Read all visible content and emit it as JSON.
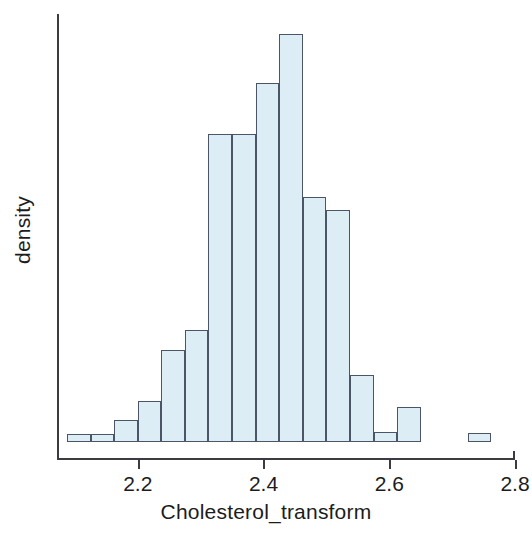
{
  "chart_data": {
    "type": "bar",
    "subtype": "histogram",
    "title": "",
    "xlabel": "Cholesterol_transform",
    "ylabel": "density",
    "xlim": [
      2.0716,
      2.8
    ],
    "ylim": [
      0,
      10.5
    ],
    "grid": false,
    "legend": false,
    "bin_width": 0.0375,
    "xticks": [
      "2.2",
      "2.4",
      "2.6",
      "2.8"
    ],
    "xtick_values": [
      2.2,
      2.4,
      2.6,
      2.8
    ],
    "yticks": [],
    "bar_fill_color": "#dcedf5",
    "bar_edge_color": "#4a5566",
    "axis_color": "#3b3b42",
    "bins": [
      {
        "x0": 2.0875,
        "x1": 2.125,
        "density": 0.2
      },
      {
        "x0": 2.125,
        "x1": 2.1625,
        "density": 0.2
      },
      {
        "x0": 2.1625,
        "x1": 2.2,
        "density": 0.55
      },
      {
        "x0": 2.2,
        "x1": 2.2375,
        "density": 1.0
      },
      {
        "x0": 2.2375,
        "x1": 2.275,
        "density": 2.25
      },
      {
        "x0": 2.275,
        "x1": 2.3125,
        "density": 2.75
      },
      {
        "x0": 2.3125,
        "x1": 2.35,
        "density": 7.55
      },
      {
        "x0": 2.35,
        "x1": 2.3875,
        "density": 7.55
      },
      {
        "x0": 2.3875,
        "x1": 2.425,
        "density": 8.8
      },
      {
        "x0": 2.425,
        "x1": 2.4625,
        "density": 10.0
      },
      {
        "x0": 2.4625,
        "x1": 2.5,
        "density": 6.0
      },
      {
        "x0": 2.5,
        "x1": 2.5375,
        "density": 5.7
      },
      {
        "x0": 2.5375,
        "x1": 2.575,
        "density": 1.65
      },
      {
        "x0": 2.575,
        "x1": 2.6125,
        "density": 0.25
      },
      {
        "x0": 2.6125,
        "x1": 2.65,
        "density": 0.85
      },
      {
        "x0": 2.65,
        "x1": 2.6875,
        "density": 0.0
      },
      {
        "x0": 2.6875,
        "x1": 2.725,
        "density": 0.0
      },
      {
        "x0": 2.725,
        "x1": 2.7625,
        "density": 0.22
      }
    ]
  },
  "axes": {
    "x_label": "Cholesterol_transform",
    "y_label": "density"
  }
}
